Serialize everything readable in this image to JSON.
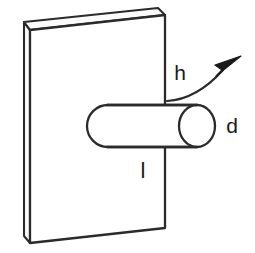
{
  "figure": {
    "type": "engineering-line-diagram",
    "background_color": "#ffffff",
    "line_color": "#2b2b2b",
    "face_fill": "#ffffff",
    "edge_fill": "#f2f2f2"
  },
  "labels": {
    "height": "h",
    "diameter": "d",
    "length": "l"
  },
  "annotations": {
    "curved_arrow_name": "height-arrow",
    "curved_arrow_direction": "up-right"
  },
  "geometry": {
    "plate": {
      "front_face": "30,30 165,15 165,228 30,243",
      "top_face": "30,30 24,22 158,8 165,15",
      "left_face": "30,30 24,22 24,236 30,243"
    },
    "cylinder": {
      "axis_y": 126,
      "left_x": 90,
      "right_x": 197,
      "radius_y": 21,
      "cap_radius_x": 18
    }
  }
}
